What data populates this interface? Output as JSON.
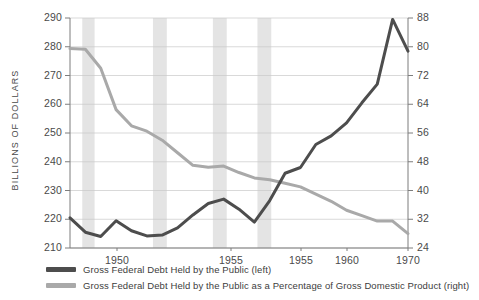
{
  "chart_data": {
    "type": "line",
    "title": "",
    "xlabel": "",
    "ylabel": "BILLIONS OF DOLLARS",
    "y2label": "",
    "grid": true,
    "legend_position": "bottom-left",
    "x": [
      1948,
      1949,
      1950,
      1951,
      1952,
      1953,
      1954,
      1955,
      1956,
      1957,
      1958,
      1959,
      1960,
      1961,
      1962,
      1963,
      1964,
      1965,
      1966,
      1967,
      1968,
      1969,
      1970
    ],
    "xticks": [
      1950,
      1955,
      1955,
      1960,
      1970
    ],
    "ylim": [
      210,
      290
    ],
    "yticks": [
      210,
      220,
      230,
      240,
      250,
      260,
      270,
      280,
      290
    ],
    "y2lim": [
      24,
      88
    ],
    "y2ticks": [
      24,
      32,
      40,
      48,
      56,
      64,
      72,
      80,
      88
    ],
    "recession_bands": [
      {
        "start": 1948.8,
        "end": 1949.6
      },
      {
        "start": 1953.4,
        "end": 1954.3
      },
      {
        "start": 1957.3,
        "end": 1958.2
      },
      {
        "start": 1960.2,
        "end": 1961.1
      }
    ],
    "series": [
      {
        "name": "Gross Federal Debt Held by the Public (left)",
        "axis": "left",
        "color": "#4d4d4d",
        "values": [
          220.5,
          215.5,
          214.0,
          219.5,
          216.0,
          214.2,
          214.5,
          217.0,
          221.5,
          225.5,
          227.0,
          223.5,
          219.0,
          226.5,
          236.0,
          238.0,
          246.0,
          249.0,
          253.5,
          260.5,
          267.0,
          289.5,
          278.5
        ]
      },
      {
        "name": "Gross Federal Debt Held by the Public as a Percentage of Gross Domestic Product (right)",
        "axis": "right",
        "color": "#a9a9a9",
        "values": [
          79.5,
          79.3,
          74.0,
          62.5,
          58.0,
          56.5,
          54.0,
          50.5,
          47.0,
          46.5,
          46.8,
          45.0,
          43.5,
          43.0,
          42.0,
          41.0,
          39.0,
          37.0,
          34.5,
          33.0,
          31.5,
          31.5,
          28.0
        ]
      }
    ],
    "legend": [
      {
        "label": "Gross Federal Debt Held by the Public (left)",
        "color": "#4d4d4d"
      },
      {
        "label": "Gross Federal Debt Held by the Public as a Percentage of Gross Domestic Product (right)",
        "color": "#a9a9a9"
      }
    ],
    "colors": {
      "debt_line": "#4d4d4d",
      "gdp_line": "#a9a9a9",
      "recession_band": "#e4e4e4",
      "gridline": "#c9c9c9",
      "axis": "#7d7d7d",
      "background": "#ffffff"
    }
  }
}
